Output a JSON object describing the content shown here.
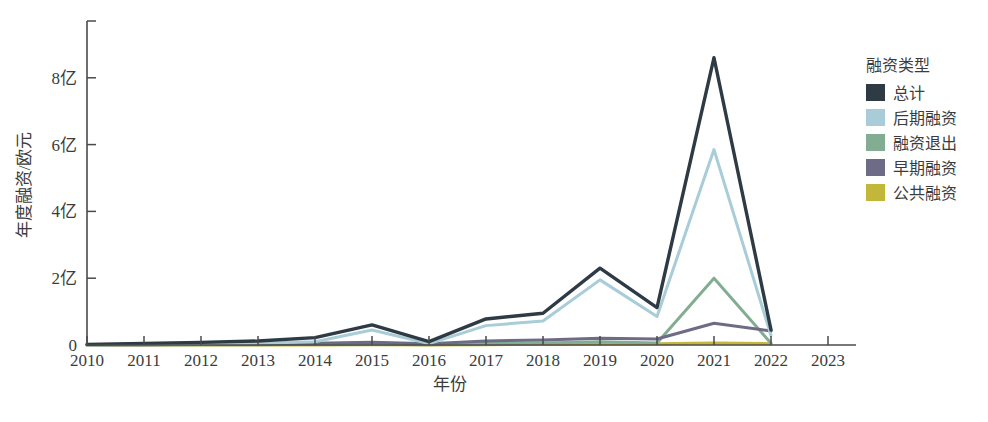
{
  "chart_data": {
    "type": "line",
    "title": "",
    "xlabel": "年份",
    "ylabel": "年度融资/欧元",
    "x": [
      2010,
      2011,
      2012,
      2013,
      2014,
      2015,
      2016,
      2017,
      2018,
      2019,
      2020,
      2021,
      2022
    ],
    "xtick_labels": [
      "2010",
      "2011",
      "2012",
      "2013",
      "2014",
      "2015",
      "2016",
      "2017",
      "2018",
      "2019",
      "2020",
      "2021",
      "2022",
      "2023"
    ],
    "xticks": [
      2010,
      2011,
      2012,
      2013,
      2014,
      2015,
      2016,
      2017,
      2018,
      2019,
      2020,
      2021,
      2022,
      2023
    ],
    "ytick_labels": [
      "0",
      "2亿",
      "4亿",
      "6亿",
      "8亿"
    ],
    "yticks": [
      0,
      2,
      4,
      6,
      8
    ],
    "ylim": [
      0,
      9.7
    ],
    "xlim": [
      2010,
      2023
    ],
    "grid": false,
    "legend_position": "right",
    "legend_title": "融资类型",
    "series": [
      {
        "name": "总计",
        "color": "#2e3a44",
        "values": [
          0.02,
          0.05,
          0.08,
          0.12,
          0.22,
          0.6,
          0.1,
          0.78,
          0.95,
          2.3,
          1.12,
          8.6,
          0.45
        ]
      },
      {
        "name": "后期融资",
        "color": "#a8cdd8",
        "values": [
          0.01,
          0.02,
          0.03,
          0.05,
          0.1,
          0.45,
          0.04,
          0.58,
          0.72,
          1.95,
          0.85,
          5.85,
          0.28
        ]
      },
      {
        "name": "融资退出",
        "color": "#82ad92",
        "values": [
          0.0,
          0.0,
          0.01,
          0.01,
          0.02,
          0.03,
          0.01,
          0.05,
          0.06,
          0.1,
          0.06,
          2.0,
          0.05
        ]
      },
      {
        "name": "早期融资",
        "color": "#6d6b86",
        "values": [
          0.01,
          0.01,
          0.02,
          0.03,
          0.05,
          0.08,
          0.04,
          0.12,
          0.15,
          0.2,
          0.18,
          0.65,
          0.42
        ]
      },
      {
        "name": "公共融资",
        "color": "#c3b73a",
        "values": [
          0.0,
          0.0,
          0.0,
          0.0,
          0.0,
          0.01,
          0.0,
          0.01,
          0.02,
          0.03,
          0.04,
          0.06,
          0.04
        ]
      }
    ]
  },
  "legend": {
    "title": "融资类型",
    "items": [
      {
        "label": "总计",
        "color": "#2e3a44"
      },
      {
        "label": "后期融资",
        "color": "#a8cdd8"
      },
      {
        "label": "融资退出",
        "color": "#82ad92"
      },
      {
        "label": "早期融资",
        "color": "#6d6b86"
      },
      {
        "label": "公共融资",
        "color": "#c3b73a"
      }
    ]
  },
  "axes": {
    "y_title": "年度融资/欧元",
    "x_title": "年份"
  }
}
